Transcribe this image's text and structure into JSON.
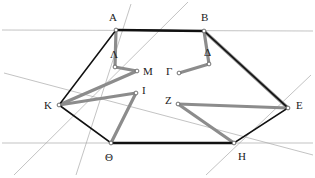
{
  "figure": {
    "width": 315,
    "height": 178,
    "background_color": "#ffffff",
    "colors": {
      "hexagon_stroke": "#111111",
      "polyline_stroke": "#8c8c8c",
      "construction_stroke": "#a9a9a9",
      "vertex_fill": "#ffffff",
      "vertex_stroke": "#555555",
      "label_color": "#1a1a1a"
    },
    "stroke_widths": {
      "hexagon": 1.6,
      "hexagon_heavy": 2.6,
      "polyline": 3.2,
      "construction": 0.7
    }
  },
  "points": {
    "A": {
      "label": "A",
      "x": 116,
      "y": 30,
      "label_x": 109,
      "label_y": 12
    },
    "B": {
      "label": "B",
      "x": 204,
      "y": 31,
      "label_x": 201,
      "label_y": 12
    },
    "E": {
      "label": "E",
      "x": 288,
      "y": 108,
      "label_x": 296,
      "label_y": 100
    },
    "H": {
      "label": "H",
      "x": 234,
      "y": 143,
      "label_x": 238,
      "label_y": 151
    },
    "Theta": {
      "label": "Θ",
      "x": 111,
      "y": 143,
      "label_x": 105,
      "label_y": 152
    },
    "K": {
      "label": "K",
      "x": 59,
      "y": 105,
      "label_x": 44,
      "label_y": 100
    },
    "Lambda": {
      "label": "Λ",
      "x": 115,
      "y": 67,
      "label_x": 110,
      "label_y": 49
    },
    "M": {
      "label": "M",
      "x": 137,
      "y": 71,
      "label_x": 143,
      "label_y": 66
    },
    "Gamma": {
      "label": "Γ",
      "x": 179,
      "y": 73,
      "label_x": 166,
      "label_y": 66
    },
    "Delta": {
      "label": "Δ",
      "x": 209,
      "y": 64,
      "label_x": 204,
      "label_y": 47
    },
    "I": {
      "label": "I",
      "x": 136,
      "y": 93,
      "label_x": 142,
      "label_y": 85
    },
    "Z": {
      "label": "Z",
      "x": 178,
      "y": 104,
      "label_x": 165,
      "label_y": 95
    }
  },
  "shapes": {
    "hexagon": {
      "name": "hexagon-ABEHThetaK",
      "vertex_order": [
        "A",
        "B",
        "E",
        "H",
        "Theta",
        "K"
      ],
      "path": "116,30 204,31 288,108 234,143 111,143 59,105",
      "closed": true
    },
    "hexagon_heavy_edges": [
      {
        "name": "edge-A-B",
        "path": "116,30 204,31"
      },
      {
        "name": "edge-Theta-H",
        "path": "111,143 234,143"
      }
    ],
    "polylines": [
      {
        "name": "polyline-A-Lambda-M-K",
        "points": "116,30 115,67 137,71 59,105"
      },
      {
        "name": "polyline-B-Delta-Gamma",
        "points": "204,31 209,64 179,73"
      },
      {
        "name": "polyline-B-E",
        "points": "204,31 288,108"
      },
      {
        "name": "polyline-K-I-Theta",
        "points": "59,105 136,93 136,93 111,143"
      },
      {
        "name": "polyline-Z-E",
        "points": "178,104 288,108"
      },
      {
        "name": "polyline-Z-H",
        "points": "178,104 234,143"
      }
    ],
    "construction_lines": [
      {
        "name": "line-horizontal-top",
        "x1": 2,
        "y1": 30,
        "x2": 313,
        "y2": 31
      },
      {
        "name": "line-horizontal-bottom",
        "x1": 2,
        "y1": 143,
        "x2": 313,
        "y2": 143
      },
      {
        "name": "line-through-A-Theta",
        "x1": 131,
        "y1": 4,
        "x2": 76,
        "y2": 175
      },
      {
        "name": "line-through-B-K",
        "x1": 188,
        "y1": 2,
        "x2": 14,
        "y2": 175
      },
      {
        "name": "line-through-K-E",
        "x1": 4,
        "y1": 73,
        "x2": 313,
        "y2": 155
      },
      {
        "name": "line-through-E-H",
        "x1": 311,
        "y1": 75,
        "x2": 206,
        "y2": 175
      }
    ]
  },
  "labels": [
    {
      "key": "A",
      "text": "A"
    },
    {
      "key": "B",
      "text": "B"
    },
    {
      "key": "E",
      "text": "E"
    },
    {
      "key": "H",
      "text": "H"
    },
    {
      "key": "Theta",
      "text": "Θ"
    },
    {
      "key": "K",
      "text": "K"
    },
    {
      "key": "Lambda",
      "text": "Λ"
    },
    {
      "key": "M",
      "text": "M"
    },
    {
      "key": "Gamma",
      "text": "Γ"
    },
    {
      "key": "Delta",
      "text": "Δ"
    },
    {
      "key": "I",
      "text": "I"
    },
    {
      "key": "Z",
      "text": "Z"
    }
  ]
}
